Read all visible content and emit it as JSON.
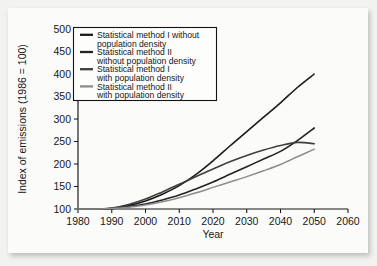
{
  "chart_data": {
    "type": "line",
    "title": "",
    "xlabel": "Year",
    "ylabel": "Index of emissions (1986 = 100)",
    "xlim": [
      1980,
      2060
    ],
    "ylim": [
      100,
      500
    ],
    "xticks": [
      1980,
      1990,
      2000,
      2010,
      2020,
      2030,
      2040,
      2050,
      2060
    ],
    "yticks": [
      100,
      150,
      200,
      250,
      300,
      350,
      400,
      450,
      500
    ],
    "grid": false,
    "legend_position": "top-left",
    "x": [
      1986,
      1990,
      1995,
      2000,
      2005,
      2010,
      2015,
      2020,
      2025,
      2030,
      2035,
      2040,
      2045,
      2050
    ],
    "series": [
      {
        "name": "Statistical method I without population density",
        "color": "#1b1b1b",
        "values": [
          100,
          101,
          108,
          118,
          133,
          152,
          177,
          207,
          240,
          272,
          304,
          336,
          370,
          400
        ]
      },
      {
        "name": "Statistical method II without population density",
        "color": "#232323",
        "values": [
          100,
          101,
          106,
          111,
          120,
          131,
          145,
          160,
          177,
          194,
          211,
          228,
          252,
          280
        ]
      },
      {
        "name": "Statistical method I with population density",
        "color": "#3f3f3f",
        "values": [
          100,
          102,
          110,
          122,
          138,
          155,
          172,
          189,
          205,
          219,
          231,
          241,
          248,
          245
        ]
      },
      {
        "name": "Statistical method II with population density",
        "color": "#8d8d8d",
        "values": [
          100,
          101,
          104,
          109,
          116,
          125,
          136,
          148,
          160,
          172,
          185,
          199,
          216,
          233
        ]
      }
    ]
  },
  "legend": {
    "entries": [
      {
        "line1": "Statistical method I without",
        "line2": "population density"
      },
      {
        "line1": "Statistical method II",
        "line2": "without population density"
      },
      {
        "line1": "Statistical method I",
        "line2": "with population density"
      },
      {
        "line1": "Statistical method II",
        "line2": "with population density"
      }
    ]
  }
}
